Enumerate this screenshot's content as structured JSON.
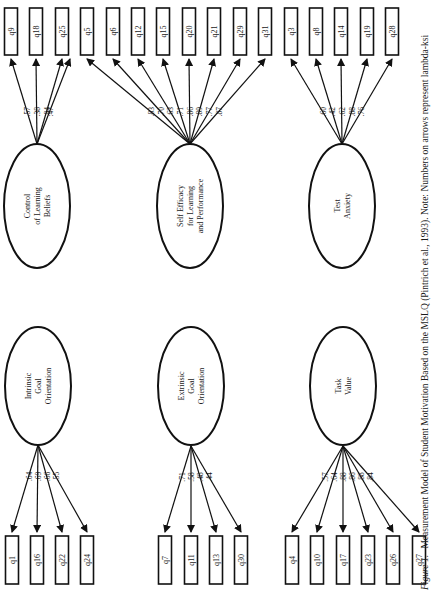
{
  "figure": {
    "caption_label": "Figure 1.",
    "caption_text": "Measurement Model of Student Motivation Based on the MSLQ (Pintrich et al., 1993).  Note:  Numbers on arrows represent lambda-ksi",
    "orientation": "rotated 90 degrees clockwise"
  },
  "factors": [
    {
      "id": "control",
      "label_lines": [
        "Control",
        "of Learning",
        "Beliefs"
      ],
      "cx": 37,
      "cy": 206,
      "rx": 33,
      "ry": 62,
      "apex": [
        37,
        144
      ],
      "row": "top",
      "items": [
        {
          "name": "q9",
          "loading": ".57",
          "x": 11
        },
        {
          "name": "q18",
          "loading": ".38",
          "x": 36
        },
        {
          "name": "q25",
          "loading": ".84",
          "x": 62
        },
        {
          "name": "",
          "loading": ".47",
          "x": 62,
          "hidden": true
        }
      ]
    },
    {
      "id": "selfefficacy",
      "label_lines": [
        "Self Efficacy",
        "for Learning",
        "and Performance"
      ],
      "cx": 190,
      "cy": 206,
      "rx": 33,
      "ry": 62,
      "apex": [
        190,
        144
      ],
      "row": "top",
      "items": [
        {
          "name": "q5",
          "loading": ".83",
          "x": 87
        },
        {
          "name": "q6",
          "loading": ".70",
          "x": 113
        },
        {
          "name": "q12",
          "loading": ".63",
          "x": 138
        },
        {
          "name": "q15",
          "loading": ".71",
          "x": 163
        },
        {
          "name": "q20",
          "loading": ".86",
          "x": 189
        },
        {
          "name": "q21",
          "loading": ".89",
          "x": 214
        },
        {
          "name": "q29",
          "loading": ".77",
          "x": 240
        },
        {
          "name": "q31",
          "loading": ".87",
          "x": 265
        }
      ]
    },
    {
      "id": "testanxiety",
      "label_lines": [
        "Test",
        "Anxiety"
      ],
      "cx": 342,
      "cy": 206,
      "rx": 33,
      "ry": 62,
      "apex": [
        342,
        144
      ],
      "row": "top",
      "items": [
        {
          "name": "q3",
          "loading": ".60",
          "x": 291
        },
        {
          "name": "q8",
          "loading": ".42",
          "x": 316
        },
        {
          "name": "q14",
          "loading": ".62",
          "x": 341
        },
        {
          "name": "q19",
          "loading": ".88",
          "x": 367
        },
        {
          "name": "q28",
          "loading": ".76",
          "x": 392
        }
      ]
    },
    {
      "id": "intrinsic",
      "label_lines": [
        "Intrinsic",
        "Goal",
        "Orientation"
      ],
      "cx": 38,
      "cy": 386,
      "rx": 33,
      "ry": 59,
      "apex": [
        38,
        445
      ],
      "row": "bottom",
      "items": [
        {
          "name": "q1",
          "loading": ".64",
          "x": 12
        },
        {
          "name": "q16",
          "loading": ".69",
          "x": 37
        },
        {
          "name": "q22",
          "loading": ".66",
          "x": 62
        },
        {
          "name": "q24",
          "loading": ".55",
          "x": 87
        }
      ]
    },
    {
      "id": "extrinsic",
      "label_lines": [
        "Extrinsic",
        "Goal",
        "Orientation"
      ],
      "cx": 191,
      "cy": 386,
      "rx": 33,
      "ry": 59,
      "apex": [
        191,
        446
      ],
      "row": "bottom",
      "items": [
        {
          "name": "q7",
          "loading": ".71",
          "x": 165
        },
        {
          "name": "q11",
          "loading": ".58",
          "x": 191
        },
        {
          "name": "q13",
          "loading": ".48",
          "x": 216
        },
        {
          "name": "q30",
          "loading": ".44",
          "x": 241
        }
      ]
    },
    {
      "id": "taskvalue",
      "label_lines": [
        "Task",
        "Value"
      ],
      "cx": 343,
      "cy": 386,
      "rx": 33,
      "ry": 59,
      "apex": [
        343,
        446
      ],
      "row": "bottom",
      "items": [
        {
          "name": "q4",
          "loading": ".57",
          "x": 292
        },
        {
          "name": "q10",
          "loading": ".64",
          "x": 317
        },
        {
          "name": "q17",
          "loading": ".88",
          "x": 343
        },
        {
          "name": "q23",
          "loading": ".86",
          "x": 368
        },
        {
          "name": "q26",
          "loading": ".88",
          "x": 393
        },
        {
          "name": "q27",
          "loading": ".84",
          "x": 419
        }
      ]
    }
  ],
  "layout": {
    "top_box_y": 8,
    "top_box_h": 47,
    "bottom_box_y": 536,
    "bottom_box_h": 48,
    "box_w": 13
  }
}
